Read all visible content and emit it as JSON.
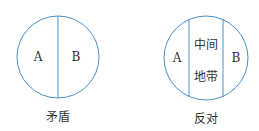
{
  "diagrams": [
    {
      "caption": "矛盾",
      "regions": [
        "A",
        "B"
      ]
    },
    {
      "caption": "反对",
      "regions": [
        "A",
        "中间",
        "地带",
        "B"
      ]
    }
  ],
  "colors": {
    "stroke": "#4a90c8",
    "text": "#333333"
  }
}
